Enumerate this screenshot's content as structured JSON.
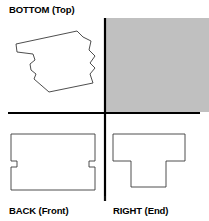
{
  "diagram": {
    "title_labels": {
      "bottom_top": "BOTTOM (Top)",
      "back_front": "BACK (Front)",
      "right_end": "RIGHT (End)"
    },
    "colors": {
      "outline": "#000000",
      "axis": "#000000",
      "gray_panel_fill": "#c0c0c0",
      "gray_panel_stroke": "#c0c0c0",
      "background": "#ffffff"
    },
    "axes": {
      "horizontal": {
        "x1": 8,
        "y1": 113,
        "x2": 200,
        "y2": 113,
        "width": 2.2
      },
      "vertical": {
        "x1": 105,
        "y1": 18,
        "x2": 105,
        "y2": 201,
        "width": 2.2
      }
    },
    "quadrants": [
      {
        "name": "top-left",
        "view": "BOTTOM (Top)",
        "shape_type": "irregular-rotated-polygon",
        "stroke_width": 0.9,
        "fill": "none",
        "points": "16,44 77,31 83,37 91,41 89,50 95,56 90,63 95,68 90,74 93,83 49,92 34,79 36,74 31,70 30,64 35,60 33,54 17,52"
      },
      {
        "name": "top-right",
        "view": "",
        "shape_type": "filled-rectangle",
        "stroke_width": 0,
        "fill": "#c0c0c0",
        "rect": {
          "x": 106,
          "y": 18,
          "width": 103,
          "height": 94
        }
      },
      {
        "name": "bottom-left",
        "view": "BACK (Front)",
        "shape_type": "stepped-rectangle",
        "stroke_width": 0.9,
        "fill": "none",
        "points": "11,134 95,134 95,161 89,161 89,167 95,167 95,190 11,190 11,167 17,167 17,161 11,161"
      },
      {
        "name": "bottom-right",
        "view": "RIGHT (End)",
        "shape_type": "tee",
        "stroke_width": 0.9,
        "fill": "none",
        "points": "113,134 185,134 185,161 166,161 166,187 131,187 131,161 113,161"
      }
    ]
  }
}
